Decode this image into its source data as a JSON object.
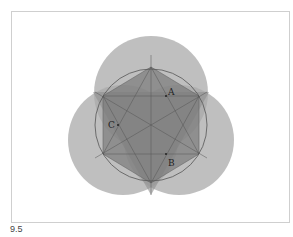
{
  "figure": {
    "caption": "9.5",
    "points": [
      {
        "label": "A"
      },
      {
        "label": "B"
      },
      {
        "label": "C"
      }
    ],
    "colors": {
      "outer_circle_fill": "#a8a8a8",
      "hexagon_fill": "#7c7c7c",
      "triangle_fill": "#8a8a8a",
      "line_color": "#555555",
      "frame_border": "#cfcfcf",
      "label_color": "#222222"
    }
  }
}
